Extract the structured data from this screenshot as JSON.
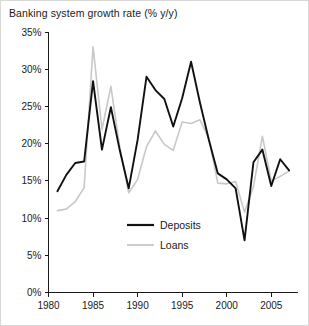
{
  "chart_data": {
    "type": "line",
    "title": "Banking system growth rate (% y/y)",
    "xlabel": "",
    "ylabel": "",
    "grid": false,
    "legend_position": "center",
    "xlim": [
      1980,
      2008
    ],
    "ylim": [
      0,
      35
    ],
    "xticks": [
      1980,
      1985,
      1990,
      1995,
      2000,
      2005
    ],
    "xtick_labels": [
      "1980",
      "1985",
      "1990",
      "1995",
      "2000",
      "2005"
    ],
    "yticks": [
      0,
      5,
      10,
      15,
      20,
      25,
      30,
      35
    ],
    "ytick_labels": [
      "0%",
      "5%",
      "10%",
      "15%",
      "20%",
      "25%",
      "30%",
      "35%"
    ],
    "x": [
      1981,
      1982,
      1983,
      1984,
      1985,
      1986,
      1987,
      1988,
      1989,
      1990,
      1991,
      1992,
      1993,
      1994,
      1995,
      1996,
      1997,
      1998,
      1999,
      2000,
      2001,
      2002,
      2003,
      2004,
      2005,
      2006,
      2007
    ],
    "series": [
      {
        "name": "Deposits",
        "color": "#111111",
        "values": [
          13.6,
          15.8,
          17.4,
          17.6,
          28.4,
          19.2,
          24.9,
          19.1,
          14.0,
          20.5,
          29.0,
          27.2,
          26.0,
          22.3,
          26.1,
          31.0,
          25.5,
          20.5,
          16.0,
          15.2,
          14.0,
          7.0,
          17.5,
          19.2,
          14.3,
          17.9,
          16.4
        ]
      },
      {
        "name": "Loans",
        "color": "#c8c8c8",
        "values": [
          11.0,
          11.2,
          12.2,
          14.1,
          33.0,
          21.9,
          27.7,
          19.5,
          13.4,
          15.2,
          19.6,
          21.7,
          19.9,
          19.1,
          22.9,
          22.7,
          23.2,
          20.7,
          14.7,
          14.6,
          14.9,
          10.8,
          14.2,
          21.0,
          15.0,
          15.6,
          16.3
        ]
      }
    ]
  },
  "legend": {
    "items": [
      {
        "label": "Deposits",
        "color": "#111111"
      },
      {
        "label": "Loans",
        "color": "#c8c8c8"
      }
    ]
  }
}
